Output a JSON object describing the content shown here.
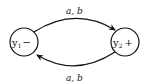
{
  "diagram": {
    "type": "state-transition",
    "states": [
      {
        "id": "y1",
        "name": "y",
        "subscript": "1",
        "sign": "−"
      },
      {
        "id": "y2",
        "name": "y",
        "subscript": "2",
        "sign": "+"
      }
    ],
    "edges": [
      {
        "from": "y1",
        "to": "y2",
        "label": "a, b"
      },
      {
        "from": "y2",
        "to": "y1",
        "label": "a, b"
      }
    ],
    "colors": {
      "stroke": "#111111",
      "background": "#ffffff"
    }
  }
}
